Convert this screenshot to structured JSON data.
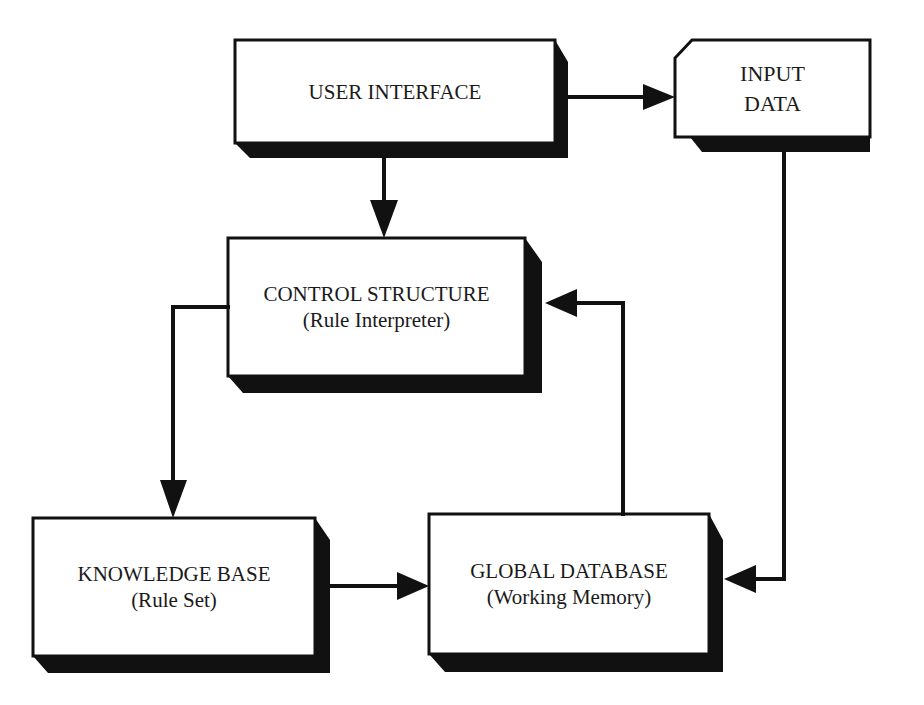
{
  "diagram": {
    "type": "block-diagram",
    "colors": {
      "background": "#ffffff",
      "stroke": "#111111",
      "shadow": "#111111",
      "box_fill": "#ffffff",
      "text": "#1a1a1a"
    },
    "nodes": [
      {
        "id": "user_interface",
        "title": "USER INTERFACE",
        "subtitle": ""
      },
      {
        "id": "input_data",
        "title": "INPUT",
        "subtitle": "DATA"
      },
      {
        "id": "control_structure",
        "title": "CONTROL STRUCTURE",
        "subtitle": "(Rule Interpreter)"
      },
      {
        "id": "knowledge_base",
        "title": "KNOWLEDGE BASE",
        "subtitle": "(Rule Set)"
      },
      {
        "id": "global_database",
        "title": "GLOBAL DATABASE",
        "subtitle": "(Working Memory)"
      }
    ],
    "edges": [
      {
        "from": "user_interface",
        "to": "input_data"
      },
      {
        "from": "user_interface",
        "to": "control_structure"
      },
      {
        "from": "control_structure",
        "to": "knowledge_base"
      },
      {
        "from": "knowledge_base",
        "to": "global_database"
      },
      {
        "from": "global_database",
        "to": "control_structure"
      },
      {
        "from": "input_data",
        "to": "global_database"
      }
    ]
  }
}
